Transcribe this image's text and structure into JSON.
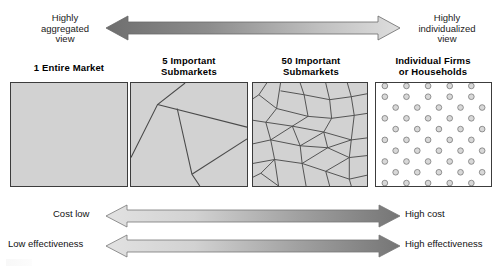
{
  "diagram": {
    "title_hidden": "Market aggregation versus individualization continuum",
    "top_arrow": {
      "left_label": "Highly\naggregated\nview",
      "right_label": "Highly\nindividualized\nview",
      "direction": "double",
      "gradient_from": "#6e6e6e",
      "gradient_to": "#d8d8d8"
    },
    "panels": [
      {
        "title": "1 Entire Market",
        "kind": "solid",
        "fill": "#d2d2d2",
        "cells": 1
      },
      {
        "title": "5 Important\nSubmarkets",
        "kind": "few-segments",
        "fill": "#d2d2d2",
        "cells": 5
      },
      {
        "title": "50 Important\nSubmarkets",
        "kind": "many-segments",
        "fill": "#d2d2d2",
        "cells": 50
      },
      {
        "title": "Individual Firms\nor Households",
        "kind": "dots",
        "fill": "#ffffff",
        "cells": 54
      }
    ],
    "bottom_arrows": [
      {
        "left_label": "Cost low",
        "right_label": "High cost",
        "direction": "double",
        "gradient_from": "#dddddd",
        "gradient_to": "#757575"
      },
      {
        "left_label": "Low effectiveness",
        "right_label": "High effectiveness",
        "direction": "double",
        "gradient_from": "#dddddd",
        "gradient_to": "#757575"
      }
    ]
  }
}
